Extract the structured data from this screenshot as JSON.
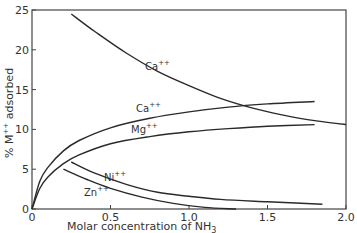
{
  "chart_data": {
    "type": "line",
    "title": "",
    "xlabel": "Molar concentration of NH3",
    "ylabel": "% M++ adsorbed",
    "xlim": [
      0,
      2.0
    ],
    "ylim": [
      0,
      25
    ],
    "xticks": [
      "0",
      "0.5",
      "1.0",
      "1.5",
      "2.0"
    ],
    "yticks": [
      "0",
      "5",
      "10",
      "15",
      "20",
      "25"
    ],
    "grid": false,
    "legend": "inline labels",
    "series": [
      {
        "name": "Ca++ (decreasing)",
        "label": "Ca",
        "x": [
          0.25,
          0.4,
          0.6,
          0.8,
          1.0,
          1.2,
          1.4,
          1.6,
          1.8,
          2.0
        ],
        "y": [
          24.5,
          22.3,
          19.6,
          17.3,
          15.5,
          13.9,
          12.7,
          11.8,
          11.1,
          10.6
        ]
      },
      {
        "name": "Ca++ (increasing)",
        "label": "Ca",
        "x": [
          0,
          0.05,
          0.1,
          0.2,
          0.3,
          0.5,
          0.75,
          1.0,
          1.25,
          1.5,
          1.8
        ],
        "y": [
          0,
          3.5,
          5.2,
          7.3,
          8.6,
          10.2,
          11.4,
          12.2,
          12.8,
          13.2,
          13.5
        ]
      },
      {
        "name": "Mg++",
        "label": "Mg",
        "x": [
          0,
          0.05,
          0.1,
          0.2,
          0.3,
          0.5,
          0.75,
          1.0,
          1.25,
          1.5,
          1.8
        ],
        "y": [
          0,
          2.6,
          4.0,
          5.7,
          6.8,
          8.2,
          9.1,
          9.7,
          10.1,
          10.4,
          10.6
        ]
      },
      {
        "name": "Ni++",
        "label": "Ni",
        "x": [
          0.25,
          0.4,
          0.6,
          0.8,
          1.0,
          1.2,
          1.5,
          1.85
        ],
        "y": [
          5.9,
          4.5,
          3.1,
          2.1,
          1.6,
          1.2,
          0.9,
          0.6
        ]
      },
      {
        "name": "Zn++",
        "label": "Zn",
        "x": [
          0.2,
          0.35,
          0.5,
          0.7,
          0.9,
          1.1,
          1.3
        ],
        "y": [
          5.0,
          3.7,
          2.6,
          1.5,
          0.7,
          0.2,
          0.0
        ]
      }
    ],
    "labels": {
      "ca_top": "Ca",
      "ca_mid": "Ca",
      "mg": "Mg",
      "ni": "Ni",
      "zn": "Zn",
      "charge": "++",
      "ylabel_main": "% M",
      "ylabel_sup": "++",
      "ylabel_tail": " adsorbed",
      "xlabel_main": "Molar concentration of NH",
      "xlabel_sub": "3"
    }
  }
}
